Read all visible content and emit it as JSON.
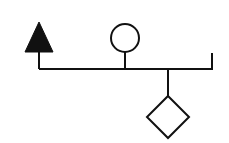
{
  "diagram": {
    "type": "pedigree-like sibship line",
    "colors": {
      "stroke": "#111111",
      "background": "#ffffff"
    },
    "sibship_line": {
      "y": 69,
      "x_start": 39,
      "x_end": 212
    },
    "members": [
      {
        "shape": "filled-triangle",
        "position": "left",
        "attached": "above"
      },
      {
        "shape": "open-circle",
        "position": "middle-left",
        "attached": "above"
      },
      {
        "shape": "open-diamond",
        "position": "middle-right",
        "attached": "below"
      },
      {
        "shape": "empty-tick",
        "position": "right",
        "attached": "above"
      }
    ]
  }
}
